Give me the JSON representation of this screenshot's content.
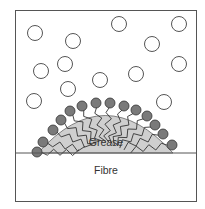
{
  "diagram": {
    "labels": {
      "grease": "Grease",
      "fibre": "Fibre"
    },
    "elements": {
      "free_molecules": "hollow circles (surfactant/water molecules in solution)",
      "adsorbed_molecules": "filled gray circles with zigzag tails penetrating grease",
      "grease_droplet": "gray dome on fibre surface"
    },
    "colors": {
      "border": "#555555",
      "grease_fill": "#cfcfcf",
      "head_fill": "#7a7a7a",
      "free_circle_stroke": "#555555"
    }
  }
}
